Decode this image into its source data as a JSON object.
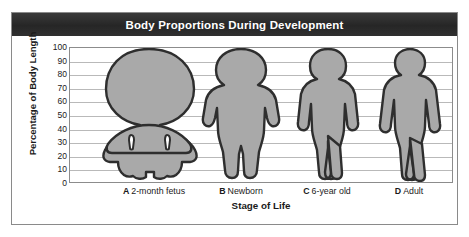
{
  "figure": {
    "title": "Body Proportions During Development"
  },
  "chart_data": {
    "type": "bar",
    "title": "Body Proportions During Development",
    "xlabel": "Stage of Life",
    "ylabel": "Percentage of Body Length",
    "ylim": [
      0,
      100
    ],
    "grid": true,
    "legend": null,
    "categories": [
      "A 2-month fetus",
      "B Newborn",
      "C 6-year old",
      "D Adult"
    ],
    "category_keys": [
      "A",
      "B",
      "C",
      "D"
    ],
    "category_names": [
      "2-month fetus",
      "Newborn",
      "6-year old",
      "Adult"
    ],
    "yticks": [
      0,
      10,
      20,
      30,
      40,
      50,
      60,
      70,
      80,
      90,
      100
    ],
    "ytick_labels": [
      "0",
      "10",
      "20",
      "30",
      "40",
      "50",
      "60",
      "70",
      "80",
      "90",
      "100"
    ],
    "series": [
      {
        "name": "Total body length",
        "values": [
          100,
          100,
          100,
          100
        ]
      },
      {
        "name": "Head height (% of body length)",
        "values": [
          50,
          25,
          17,
          13
        ]
      },
      {
        "name": "Head top (% of body length)",
        "values": [
          100,
          100,
          100,
          100
        ]
      },
      {
        "name": "Crotch / leg start (% of body length)",
        "values": [
          30,
          45,
          48,
          50
        ]
      }
    ],
    "annotation": "Silhouettes drawn to a common 100% body-length scale showing head-to-body proportion decreasing from fetus to adult."
  },
  "axis": {
    "y_title": "Percentage of Body Length",
    "x_title": "Stage of Life"
  }
}
